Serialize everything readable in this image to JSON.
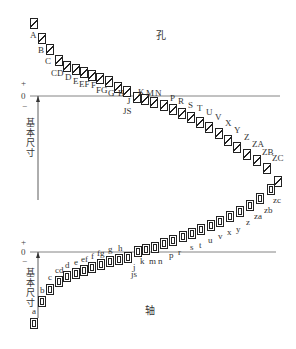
{
  "diagram": {
    "hole_title": "孔",
    "shaft_title": "轴",
    "basic_size_label": "基本尺寸",
    "zero_label": "0",
    "plus_label": "+",
    "minus_label": "−",
    "holes": [
      {
        "label": "A",
        "x": 30,
        "y": 18,
        "lx": 30,
        "ly": 31
      },
      {
        "label": "B",
        "x": 38,
        "y": 33,
        "lx": 38,
        "ly": 46
      },
      {
        "label": "C",
        "x": 46,
        "y": 44,
        "lx": 45,
        "ly": 57
      },
      {
        "label": "CD",
        "x": 55,
        "y": 55,
        "lx": 51,
        "ly": 69
      },
      {
        "label": "D",
        "x": 63,
        "y": 61,
        "lx": 65,
        "ly": 73
      },
      {
        "label": "E",
        "x": 72,
        "y": 64,
        "lx": 73,
        "ly": 77
      },
      {
        "label": "EF",
        "x": 80,
        "y": 67,
        "lx": 79,
        "ly": 80
      },
      {
        "label": "F",
        "x": 88,
        "y": 70,
        "lx": 91,
        "ly": 81
      },
      {
        "label": "FG",
        "x": 96,
        "y": 73,
        "lx": 96,
        "ly": 86
      },
      {
        "label": "G",
        "x": 105,
        "y": 76,
        "lx": 108,
        "ly": 89
      },
      {
        "label": "H",
        "x": 114,
        "y": 82,
        "lx": 118,
        "ly": 89
      },
      {
        "label": "J",
        "x": 123,
        "y": 86,
        "lx": 127,
        "ly": 97
      },
      {
        "label": "K",
        "x": 133,
        "y": 92,
        "lx": 138,
        "ly": 88
      },
      {
        "label": "M",
        "x": 141,
        "y": 94,
        "lx": 146,
        "ly": 89
      },
      {
        "label": "N",
        "x": 150,
        "y": 97,
        "lx": 155,
        "ly": 89
      },
      {
        "label": "P",
        "x": 160,
        "y": 100,
        "lx": 170,
        "ly": 94
      },
      {
        "label": "R",
        "x": 169,
        "y": 104,
        "lx": 178,
        "ly": 97
      },
      {
        "label": "S",
        "x": 178,
        "y": 108,
        "lx": 188,
        "ly": 101
      },
      {
        "label": "T",
        "x": 187,
        "y": 112,
        "lx": 197,
        "ly": 104
      },
      {
        "label": "U",
        "x": 196,
        "y": 117,
        "lx": 206,
        "ly": 108
      },
      {
        "label": "V",
        "x": 205,
        "y": 122,
        "lx": 215,
        "ly": 113
      },
      {
        "label": "X",
        "x": 215,
        "y": 128,
        "lx": 225,
        "ly": 119
      },
      {
        "label": "Y",
        "x": 224,
        "y": 135,
        "lx": 234,
        "ly": 126
      },
      {
        "label": "Z",
        "x": 233,
        "y": 142,
        "lx": 244,
        "ly": 133
      },
      {
        "label": "ZA",
        "x": 243,
        "y": 149,
        "lx": 252,
        "ly": 140
      },
      {
        "label": "ZB",
        "x": 253,
        "y": 155,
        "lx": 262,
        "ly": 148
      },
      {
        "label": "ZC",
        "x": 263,
        "y": 163,
        "lx": 272,
        "ly": 154
      },
      {
        "label": "",
        "x": 274,
        "y": 176,
        "lx": 0,
        "ly": 0
      }
    ],
    "js_hole_label": {
      "label": "JS",
      "x": 123,
      "y": 107
    },
    "shafts": [
      {
        "label": "a",
        "x": 30,
        "y": 318,
        "lx": 32,
        "ly": 307
      },
      {
        "label": "b",
        "x": 38,
        "y": 296,
        "lx": 40,
        "ly": 286
      },
      {
        "label": "c",
        "x": 46,
        "y": 284,
        "lx": 48,
        "ly": 273
      },
      {
        "label": "cd",
        "x": 55,
        "y": 276,
        "lx": 55,
        "ly": 266
      },
      {
        "label": "d",
        "x": 63,
        "y": 271,
        "lx": 65,
        "ly": 261
      },
      {
        "label": "e",
        "x": 72,
        "y": 268,
        "lx": 74,
        "ly": 258
      },
      {
        "label": "ef",
        "x": 80,
        "y": 265,
        "lx": 81,
        "ly": 255
      },
      {
        "label": "f",
        "x": 88,
        "y": 262,
        "lx": 91,
        "ly": 252
      },
      {
        "label": "fg",
        "x": 97,
        "y": 259,
        "lx": 97,
        "ly": 249
      },
      {
        "label": "g",
        "x": 106,
        "y": 256,
        "lx": 108,
        "ly": 245
      },
      {
        "label": "h",
        "x": 115,
        "y": 254,
        "lx": 118,
        "ly": 244
      },
      {
        "label": "j",
        "x": 124,
        "y": 252,
        "lx": 133,
        "ly": 263
      },
      {
        "label": "k",
        "x": 134,
        "y": 246,
        "lx": 140,
        "ly": 257
      },
      {
        "label": "m",
        "x": 142,
        "y": 244,
        "lx": 149,
        "ly": 257
      },
      {
        "label": "n",
        "x": 151,
        "y": 242,
        "lx": 158,
        "ly": 257
      },
      {
        "label": "p",
        "x": 160,
        "y": 238,
        "lx": 169,
        "ly": 251
      },
      {
        "label": "r",
        "x": 169,
        "y": 235,
        "lx": 178,
        "ly": 248
      },
      {
        "label": "s",
        "x": 179,
        "y": 231,
        "lx": 190,
        "ly": 243
      },
      {
        "label": "t",
        "x": 188,
        "y": 228,
        "lx": 199,
        "ly": 241
      },
      {
        "label": "u",
        "x": 197,
        "y": 224,
        "lx": 208,
        "ly": 236
      },
      {
        "label": "v",
        "x": 207,
        "y": 220,
        "lx": 218,
        "ly": 232
      },
      {
        "label": "x",
        "x": 216,
        "y": 216,
        "lx": 227,
        "ly": 228
      },
      {
        "label": "y",
        "x": 226,
        "y": 211,
        "lx": 236,
        "ly": 225
      },
      {
        "label": "z",
        "x": 236,
        "y": 206,
        "lx": 246,
        "ly": 218
      },
      {
        "label": "za",
        "x": 246,
        "y": 200,
        "lx": 254,
        "ly": 212
      },
      {
        "label": "zb",
        "x": 256,
        "y": 193,
        "lx": 264,
        "ly": 206
      },
      {
        "label": "zc",
        "x": 267,
        "y": 184,
        "lx": 273,
        "ly": 196
      }
    ],
    "js_shaft_label": {
      "label": "js",
      "x": 131,
      "y": 270
    }
  }
}
